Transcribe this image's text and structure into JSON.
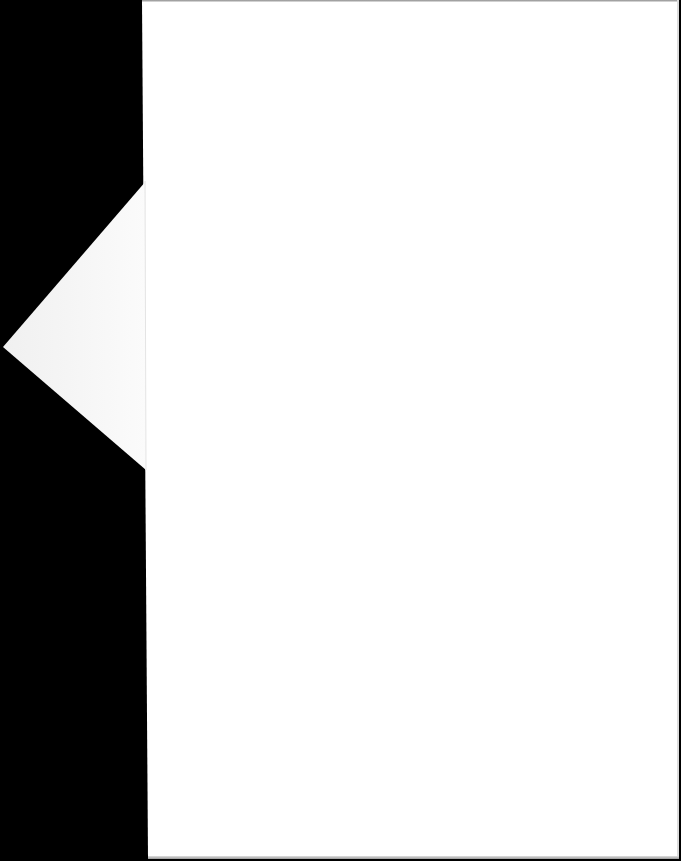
{
  "document": {
    "type": "scanned-page",
    "content_text": "",
    "colors": {
      "background": "#000000",
      "page": "#ffffff",
      "fold": "#f7f7f7"
    }
  },
  "fold": {
    "shape": "triangle",
    "points": [
      [
        146,
        181
      ],
      [
        3,
        347
      ],
      [
        146,
        470
      ]
    ]
  }
}
